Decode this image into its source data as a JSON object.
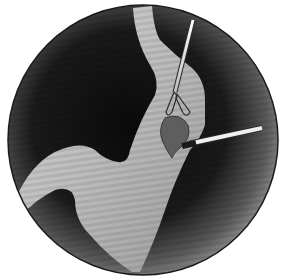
{
  "illustration": {
    "subject": "endoscopic view of esophagus and stomach with grasping forceps and probe on a lesion",
    "colors": {
      "background": "#ffffff",
      "circle_border": "#1a1a1a",
      "dark_field": "#0e0e0e",
      "mid_field": "#8a8a8a",
      "tissue_light": "#d4d4d4",
      "tissue_mid": "#b0b0b0",
      "lesion": "#5a5a5a",
      "instrument": "#e8e8e8"
    }
  }
}
